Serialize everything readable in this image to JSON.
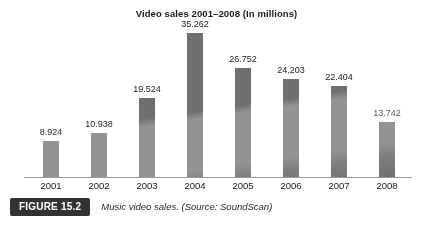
{
  "chart_data": {
    "type": "bar",
    "title": "Video sales 2001–2008 (In millions)",
    "xlabel": "",
    "ylabel": "",
    "ylim": [
      0,
      38
    ],
    "grid": false,
    "legend": "none",
    "categories": [
      "2001",
      "2002",
      "2003",
      "2004",
      "2005",
      "2006",
      "2007",
      "2008"
    ],
    "values": [
      8.924,
      10.938,
      19.524,
      35.262,
      26.752,
      24.203,
      22.404,
      13.742
    ],
    "value_labels": [
      "8.924",
      "10.938",
      "19.524",
      "35.262",
      "26.752",
      "24.203",
      "22.404",
      "13.742"
    ],
    "series": [
      {
        "name": "Music video sales",
        "values": [
          8.924,
          10.938,
          19.524,
          35.262,
          26.752,
          24.203,
          22.404,
          13.742
        ]
      }
    ],
    "bar_color": "#6f6f6f",
    "axis_color": "#9a9a9a"
  },
  "figure": {
    "badge_label": "FIGURE 15.2",
    "caption": "Music video sales. (Source: SoundScan)",
    "badge_bg": "#333333",
    "badge_text_color": "#ffffff"
  }
}
